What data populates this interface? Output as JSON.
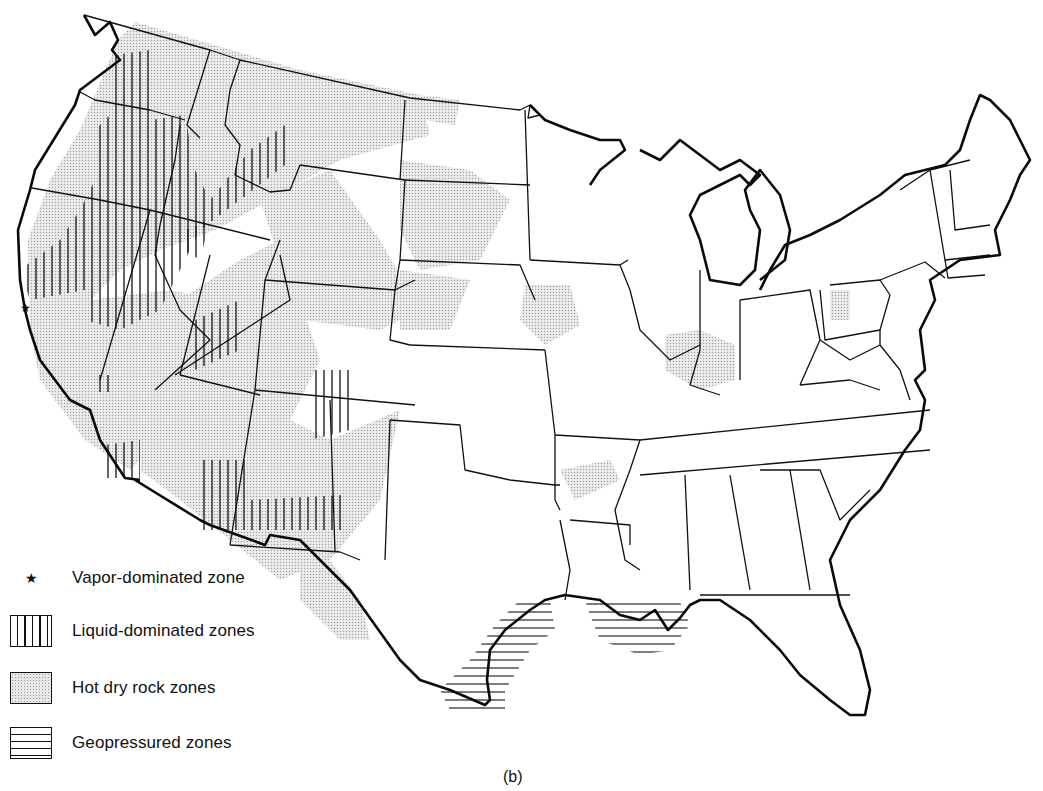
{
  "figure": {
    "caption": "(b)"
  },
  "legend": {
    "items": [
      {
        "symbol": "star-icon",
        "glyph": "★",
        "label": "Vapor-dominated zone"
      },
      {
        "symbol": "vertical-hatch-swatch",
        "label": "Liquid-dominated zones"
      },
      {
        "symbol": "stipple-swatch",
        "label": "Hot dry rock zones"
      },
      {
        "symbol": "horizontal-hatch-swatch",
        "label": "Geopressured zones"
      }
    ]
  },
  "map": {
    "colors": {
      "outline": "#111111",
      "stipple": "#d9d9d9",
      "hatch": "#111111",
      "background": "#ffffff"
    },
    "zones": {
      "vapor_dominated": [
        "Northern California (The Geysers)"
      ],
      "liquid_dominated": [
        "Oregon/Washington Cascades & Idaho",
        "Northern Nevada / NE California",
        "Utah",
        "Imperial Valley, California",
        "Southern Arizona",
        "Southern New Mexico",
        "Northern New Mexico / Colorado",
        "Central California"
      ],
      "hot_dry_rock": [
        "Western states broadly",
        "Montana",
        "Wyoming",
        "Colorado",
        "Western Dakotas",
        "Nebraska",
        "Iowa",
        "Illinois/Indiana",
        "Texas west",
        "Arkansas"
      ],
      "geopressured": [
        "Texas Gulf Coast",
        "Louisiana Gulf Coast"
      ]
    }
  }
}
